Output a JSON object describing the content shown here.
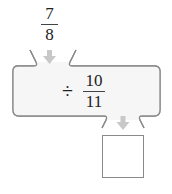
{
  "input": {
    "numerator": "7",
    "denominator": "8"
  },
  "machine": {
    "operator": "÷",
    "numerator": "10",
    "denominator": "11"
  },
  "output": {
    "value": ""
  },
  "colors": {
    "panel_fill": "#f7f7f7",
    "panel_stroke": "#888888",
    "arrow": "#c8c8c8"
  }
}
